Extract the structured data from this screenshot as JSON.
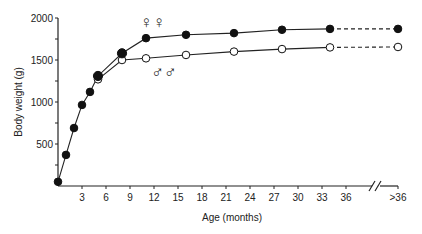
{
  "chart_data": {
    "type": "line",
    "title": "",
    "xlabel": "Age (months)",
    "ylabel": "Body weight (g)",
    "xlim": [
      0,
      36
    ],
    "ylim": [
      0,
      2000
    ],
    "x_ticks": [
      "3",
      "6",
      "9",
      "12",
      "15",
      "18",
      "21",
      "24",
      "27",
      "30",
      "33",
      "36",
      ">36"
    ],
    "y_ticks": [
      "500",
      "1000",
      "1500",
      "2000"
    ],
    "grid": false,
    "axis_break": "between 36 and >36",
    "legend": [
      {
        "name": "females",
        "symbol": "♀♀",
        "marker": "filled-circle"
      },
      {
        "name": "males",
        "symbol": "♂♂",
        "marker": "open-circle"
      }
    ],
    "series": [
      {
        "name": "females",
        "label": "♀♀",
        "marker": "filled",
        "x": [
          0,
          1,
          2,
          3,
          4,
          5,
          8,
          11,
          16,
          22,
          28,
          34,
          ">36"
        ],
        "values": [
          50,
          370,
          690,
          965,
          1120,
          1310,
          1580,
          1760,
          1800,
          1820,
          1860,
          1870,
          1870
        ]
      },
      {
        "name": "males",
        "label": "♂♂",
        "marker": "open",
        "x": [
          5,
          8,
          11,
          16,
          22,
          28,
          34,
          ">36"
        ],
        "values": [
          1270,
          1500,
          1520,
          1560,
          1600,
          1630,
          1650,
          1655
        ]
      }
    ]
  },
  "labels": {
    "xlabel": "Age (months)",
    "ylabel": "Body weight (g)",
    "female_symbol": "♀♀",
    "male_symbol": "♂♂"
  }
}
